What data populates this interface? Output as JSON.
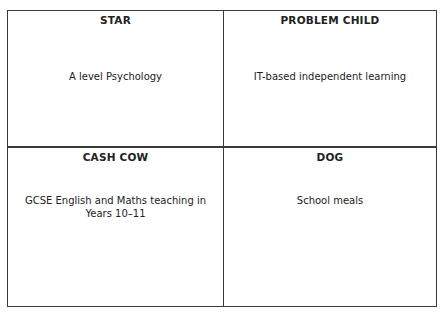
{
  "matrix": {
    "quadrants": [
      {
        "title": "STAR",
        "text": "A level Psychology"
      },
      {
        "title": "PROBLEM CHILD",
        "text": "IT-based independent learning"
      },
      {
        "title": "CASH COW",
        "text": "GCSE English and Maths teaching in Years 10–11"
      },
      {
        "title": "DOG",
        "text": "School meals"
      }
    ]
  }
}
